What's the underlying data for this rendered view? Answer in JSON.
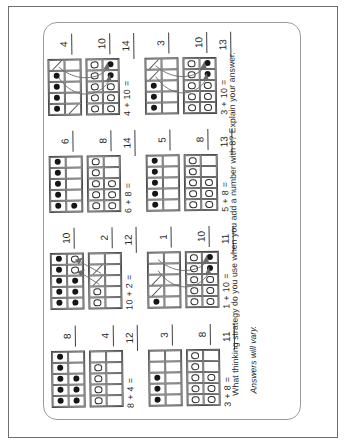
{
  "page": {
    "question": "What thinking strategy do you use when you add a number with 8? Explain your answer.",
    "answer_note": "Answers will vary.",
    "colors": {
      "outer_border": "#6e6e6e",
      "sheet_border": "#9b9b9b",
      "ink": "#2a2a2a",
      "frame_line": "#4a4a4a",
      "dot": "#161616"
    }
  },
  "legend": {
    "frame_codes": "f = filled dot, o = open circle, / = crossed-out dot, . = empty cell",
    "arrow_meaning": "curved arrows show two dots moved to make a ten"
  },
  "units": [
    {
      "id": "8-plus-4",
      "label1": "8",
      "label2": "4",
      "equation": "8 + 4 =",
      "answer": "12",
      "frame1": [
        "fffff",
        "fff.."
      ],
      "frame2": [
        "oooo.",
        "....."
      ],
      "arrows": "none"
    },
    {
      "id": "10-plus-2",
      "label1": "10",
      "label2": "2",
      "equation": "10 + 2 =",
      "answer": "12",
      "frame1": [
        "fffff",
        "fffoo"
      ],
      "frame2": [
        "oo//.",
        "....."
      ],
      "arrows": "up"
    },
    {
      "id": "6-plus-8",
      "label1": "6",
      "label2": "8",
      "equation": "6 + 8 =",
      "answer": "14",
      "frame1": [
        "fffff",
        "f...."
      ],
      "frame2": [
        "ooooo",
        "ooo.."
      ],
      "arrows": "none"
    },
    {
      "id": "4-plus-10",
      "label1": "4",
      "label2": "10",
      "equation": "4 + 10 =",
      "answer": "14",
      "frame1": [
        "ffff/",
        "/...."
      ],
      "frame2": [
        "ooooo",
        "oooff"
      ],
      "arrows": "down"
    },
    {
      "id": "3-plus-8",
      "label1": "3",
      "label2": "8",
      "equation": "3 + 8 =",
      "answer": "11",
      "frame1": [
        "fff..",
        "....."
      ],
      "frame2": [
        "ooooo",
        "ooo.."
      ],
      "arrows": "none"
    },
    {
      "id": "1-plus-10",
      "label1": "1",
      "label2": "10",
      "equation": "1 + 10 =",
      "answer": "11",
      "frame1": [
        "f//..",
        "....."
      ],
      "frame2": [
        "ooooo",
        "oooff"
      ],
      "arrows": "down"
    },
    {
      "id": "5-plus-8",
      "label1": "5",
      "label2": "8",
      "equation": "5 + 8 =",
      "answer": "13",
      "frame1": [
        "fffff",
        "....."
      ],
      "frame2": [
        "ooooo",
        "ooo.."
      ],
      "arrows": "none"
    },
    {
      "id": "3-plus-10",
      "label1": "3",
      "label2": "10",
      "equation": "3 + 10 =",
      "answer": "13",
      "frame1": [
        "fff//",
        "....."
      ],
      "frame2": [
        "ooooo",
        "oooff"
      ],
      "arrows": "down"
    }
  ],
  "grid": {
    "rows": 2,
    "cols": 4
  }
}
